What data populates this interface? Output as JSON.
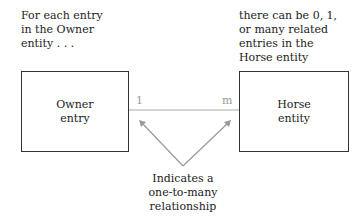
{
  "annotations": {
    "owner_note": [
      "For each entry",
      "in the Owner",
      "entity . . ."
    ],
    "horse_note": [
      "there can be 0, 1,",
      "or  many related",
      "entries in the",
      "Horse entity"
    ],
    "relationship_note": [
      "Indicates a",
      "one-to-many",
      "relationship"
    ]
  },
  "entities": {
    "owner": [
      "Owner",
      "entry"
    ],
    "horse": [
      "Horse",
      "entity"
    ]
  },
  "relationship": {
    "left_cardinality": "1",
    "right_cardinality": "m"
  },
  "colors": {
    "line": "#aaaaaa",
    "box_border": "#333333"
  }
}
